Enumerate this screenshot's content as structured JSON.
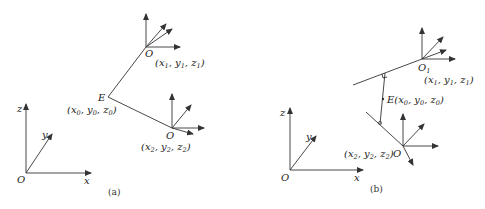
{
  "panels": [
    {
      "id": "a",
      "caption": "(a)",
      "world_axes": {
        "origin": "O",
        "x": "x",
        "y": "y",
        "z": "z"
      },
      "frame1": {
        "origin": "O",
        "coords": [
          "x",
          "1",
          "y",
          "1",
          "z",
          "1"
        ]
      },
      "frame2": {
        "origin": "O",
        "coords": [
          "x",
          "2",
          "y",
          "2",
          "z",
          "2"
        ]
      },
      "point": {
        "name": "E",
        "coords": [
          "x",
          "0",
          "y",
          "0",
          "z",
          "0"
        ]
      }
    },
    {
      "id": "b",
      "caption": "(b)",
      "world_axes": {
        "origin": "O",
        "x": "x",
        "y": "y",
        "z": "z"
      },
      "frame1": {
        "origin": "O",
        "origin_sub": "1",
        "coords": [
          "x",
          "1",
          "y",
          "1",
          "z",
          "1"
        ]
      },
      "frame2": {
        "origin": "O",
        "coords": [
          "x",
          "2",
          "y",
          "2",
          "z",
          "2"
        ]
      },
      "point": {
        "name": "E",
        "coords": [
          "x",
          "0",
          "y",
          "0",
          "z",
          "0"
        ]
      }
    }
  ]
}
